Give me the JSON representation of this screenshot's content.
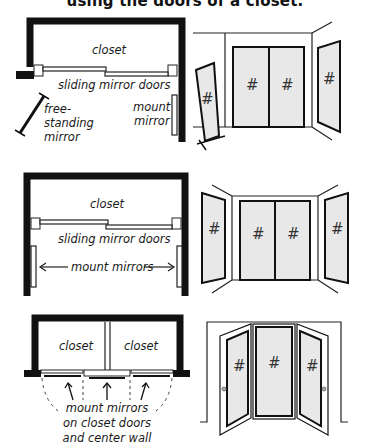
{
  "title": "using the doors of a closet.",
  "colors": {
    "wall": "#111111",
    "mirror_fill": "#e8e8e8",
    "line": "#222222",
    "background": "#ffffff"
  },
  "panels": [
    {
      "id": "option-1",
      "plan": {
        "closet_label": "closet",
        "doors_label": "sliding mirror doors",
        "mount_label_line1": "mount",
        "mount_label_line2": "mirror",
        "freestanding_label_line1": "free-",
        "freestanding_label_line2": "standing",
        "freestanding_label_line3": "mirror"
      },
      "elevation": {
        "mirror_glyph": "#"
      }
    },
    {
      "id": "option-2",
      "plan": {
        "closet_label": "closet",
        "doors_label": "sliding mirror doors",
        "arrow_label": "mount mirrors"
      },
      "elevation": {
        "mirror_glyph": "#"
      }
    },
    {
      "id": "option-3",
      "plan": {
        "closet_left_label": "closet",
        "closet_right_label": "closet",
        "caption_line1": "mount mirrors",
        "caption_line2": "on closet doors",
        "caption_line3": "and center wall"
      },
      "elevation": {
        "mirror_glyph": "#"
      }
    }
  ]
}
